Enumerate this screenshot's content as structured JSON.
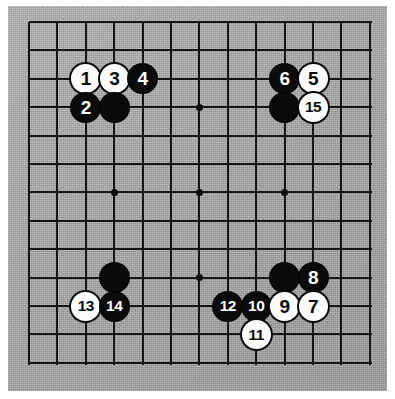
{
  "diagram": {
    "kind": "go-board-problem-diagram",
    "board_size": 13,
    "colors": {
      "board": "#ababab",
      "line": "#151515",
      "black_stone": "#0a0a0a",
      "white_stone": "#fbfbfb",
      "page": "#ffffff"
    },
    "geometry": {
      "grid_origin_x": 21,
      "grid_origin_y": 16,
      "grid_spacing": 28.4,
      "stone_diameter": 29,
      "star_point_columns": [
        4,
        7,
        10
      ],
      "star_point_rows": [
        4,
        7,
        10
      ]
    },
    "star_points": [
      {
        "col": 4,
        "row": 4
      },
      {
        "col": 7,
        "row": 4
      },
      {
        "col": 10,
        "row": 4
      },
      {
        "col": 4,
        "row": 7
      },
      {
        "col": 7,
        "row": 7
      },
      {
        "col": 10,
        "row": 7
      },
      {
        "col": 4,
        "row": 10
      },
      {
        "col": 7,
        "row": 10
      },
      {
        "col": 10,
        "row": 10
      }
    ],
    "stones": [
      {
        "name": "stone-1",
        "label": "1",
        "color": "white",
        "col": 3,
        "row": 3
      },
      {
        "name": "stone-3",
        "label": "3",
        "color": "white",
        "col": 4,
        "row": 3
      },
      {
        "name": "stone-4",
        "label": "4",
        "color": "black",
        "col": 5,
        "row": 3
      },
      {
        "name": "stone-6",
        "label": "6",
        "color": "black",
        "col": 10,
        "row": 3
      },
      {
        "name": "stone-5",
        "label": "5",
        "color": "white",
        "col": 11,
        "row": 3
      },
      {
        "name": "stone-2",
        "label": "2",
        "color": "black",
        "col": 3,
        "row": 4
      },
      {
        "name": "stone-unnumbered-black-top-left",
        "label": "",
        "color": "black",
        "col": 4,
        "row": 4
      },
      {
        "name": "stone-unnumbered-black-top-right",
        "label": "",
        "color": "black",
        "col": 10,
        "row": 4
      },
      {
        "name": "stone-15",
        "label": "15",
        "color": "white",
        "col": 11,
        "row": 4
      },
      {
        "name": "stone-unnumbered-black-bottom-left",
        "label": "",
        "color": "black",
        "col": 4,
        "row": 10
      },
      {
        "name": "stone-unnumbered-black-bottom-right",
        "label": "",
        "color": "black",
        "col": 10,
        "row": 10
      },
      {
        "name": "stone-8",
        "label": "8",
        "color": "black",
        "col": 11,
        "row": 10
      },
      {
        "name": "stone-13",
        "label": "13",
        "color": "white",
        "col": 3,
        "row": 11
      },
      {
        "name": "stone-14",
        "label": "14",
        "color": "black",
        "col": 4,
        "row": 11
      },
      {
        "name": "stone-12",
        "label": "12",
        "color": "black",
        "col": 8,
        "row": 11
      },
      {
        "name": "stone-10",
        "label": "10",
        "color": "black",
        "col": 9,
        "row": 11
      },
      {
        "name": "stone-9",
        "label": "9",
        "color": "white",
        "col": 10,
        "row": 11
      },
      {
        "name": "stone-7",
        "label": "7",
        "color": "white",
        "col": 11,
        "row": 11
      },
      {
        "name": "stone-11",
        "label": "11",
        "color": "white",
        "col": 9,
        "row": 12
      }
    ]
  }
}
